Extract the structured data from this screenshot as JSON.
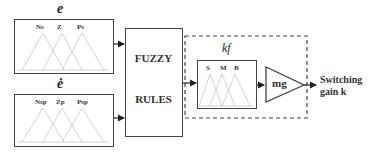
{
  "inputs": [
    {
      "title": "e",
      "mf_labels": [
        "Ns",
        "Z",
        "Ps"
      ]
    },
    {
      "title": "ė",
      "mf_labels": [
        "Nsp",
        "Zp",
        "Psp"
      ]
    }
  ],
  "rules_block": {
    "line1": "FUZZY",
    "line2": "RULES"
  },
  "output_mf": {
    "title": "kf",
    "mf_labels": [
      "S",
      "M",
      "B"
    ]
  },
  "gain_block": {
    "label": "mg"
  },
  "output": {
    "line1": "Switching",
    "line2": "gain k"
  },
  "colors": {
    "line": "#444444",
    "mf_lines": "#c8c8c8",
    "text": "#222222"
  }
}
